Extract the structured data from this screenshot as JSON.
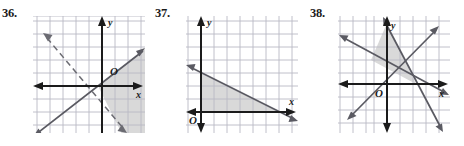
{
  "page": {
    "background_color": "#ffffff",
    "grid_color": "#b9b9c4",
    "axis_color": "#1b1b1b",
    "line_color": "#5a5a62",
    "shade_color": "#d6d6d6",
    "label_color": "#1b1b1b"
  },
  "problems": [
    {
      "number": "36.",
      "number_x": 2,
      "number_y": 8,
      "graph_x": 33,
      "graph_y": 16,
      "graph_w": 112,
      "graph_h": 117,
      "grid": {
        "cell": 13,
        "cols": 8,
        "rows": 9,
        "origin_col": 5,
        "origin_row": 5.4
      },
      "axes": {
        "x_label": "x",
        "y_label": "y",
        "origin_label": "O",
        "x_arrow_left": true,
        "x_arrow_right": true,
        "y_arrow_up": true,
        "y_arrow_down": false
      },
      "lines": [
        {
          "name": "solid-boundary-positive-slope",
          "style": "solid",
          "slope": 0.78,
          "intercept_units": 1.55,
          "arrow_start": true,
          "arrow_end": true
        },
        {
          "name": "dashed-boundary-negative-slope",
          "style": "dashed",
          "slope": -1.0,
          "intercept_units": -2.0,
          "arrow_start": true,
          "arrow_end": true
        }
      ],
      "shading": {
        "region": "right-of-both-lines",
        "description": "region to the right and below the solid line and right of the dashed line"
      }
    },
    {
      "number": "37.",
      "number_x": 155,
      "number_y": 8,
      "graph_x": 186,
      "graph_y": 16,
      "graph_w": 112,
      "graph_h": 117,
      "grid": {
        "cell": 13,
        "cols": 8,
        "rows": 9,
        "origin_col": 1.1,
        "origin_row": 7.4
      },
      "axes": {
        "x_label": "x",
        "y_label": "y",
        "origin_label": "O",
        "x_arrow_left": true,
        "x_arrow_right": true,
        "y_arrow_up": true,
        "y_arrow_down": true
      },
      "lines": [
        {
          "name": "solid-boundary-negative-slope",
          "style": "solid",
          "slope": -0.5,
          "intercept_units": 3.0,
          "arrow_start": true,
          "arrow_end": true
        }
      ],
      "shading": {
        "region": "triangle-first-quadrant",
        "description": "triangle bounded by the y-axis, the x-axis and the descending line"
      }
    },
    {
      "number": "38.",
      "number_x": 310,
      "number_y": 8,
      "graph_x": 338,
      "graph_y": 16,
      "graph_w": 112,
      "graph_h": 117,
      "grid": {
        "cell": 13,
        "cols": 8,
        "rows": 9,
        "origin_col": 3.6,
        "origin_row": 5.2
      },
      "axes": {
        "x_label": "x",
        "y_label": "y",
        "origin_label": "O",
        "x_arrow_left": true,
        "x_arrow_right": true,
        "y_arrow_up": true,
        "y_arrow_down": true
      },
      "lines": [
        {
          "name": "line-shallow-negative-slope",
          "style": "solid",
          "slope": -0.5,
          "intercept_units": 1.0,
          "arrow_start": true,
          "arrow_end": true
        },
        {
          "name": "line-steep-negative-slope",
          "style": "solid",
          "slope": -2.0,
          "intercept_units": 4.0,
          "arrow_start": true,
          "arrow_end": true
        },
        {
          "name": "line-positive-slope",
          "style": "solid",
          "slope": 1.35,
          "intercept_units": -2.7,
          "arrow_start": true,
          "arrow_end": true
        }
      ],
      "shading": {
        "region": "triangle-above-x-axis",
        "description": "triangle with apex on the y-axis and vertex on the x-axis right of the origin"
      }
    }
  ]
}
